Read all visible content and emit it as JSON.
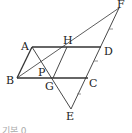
{
  "diagram": {
    "type": "geometry-figure",
    "points": {
      "A": {
        "label": "A",
        "x": 32,
        "y": 48
      },
      "H": {
        "label": "H",
        "x": 67,
        "y": 47
      },
      "D": {
        "label": "D",
        "x": 101,
        "y": 47
      },
      "B": {
        "label": "B",
        "x": 17,
        "y": 78
      },
      "P": {
        "label": "P",
        "x": 40,
        "y": 70
      },
      "G": {
        "label": "G",
        "x": 53,
        "y": 78
      },
      "C": {
        "label": "C",
        "x": 88,
        "y": 78
      },
      "E": {
        "label": "E",
        "x": 71,
        "y": 109
      },
      "F": {
        "label": "F",
        "x": 119,
        "y": 8
      }
    },
    "segments": [
      "AD",
      "BC",
      "AB",
      "DC",
      "BF",
      "AE",
      "HG",
      "FE"
    ],
    "tick_marks": [
      "FD",
      "DC",
      "CE"
    ],
    "caption": "기본 0"
  }
}
